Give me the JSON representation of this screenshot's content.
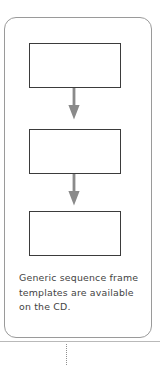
{
  "diagram": {
    "container": {
      "name": "sequence-frame-container",
      "border_color": "#9a9a9a",
      "corner_radius_px": 12
    },
    "boxes": [
      {
        "id": "box-1",
        "label": "",
        "border_color": "#3b3b3b"
      },
      {
        "id": "box-2",
        "label": "",
        "border_color": "#3b3b3b"
      },
      {
        "id": "box-3",
        "label": "",
        "border_color": "#3b3b3b"
      }
    ],
    "arrows": [
      {
        "id": "arrow-1",
        "direction": "down",
        "color": "#8a8a8a",
        "from": "box-1",
        "to": "box-2"
      },
      {
        "id": "arrow-2",
        "direction": "down",
        "color": "#8a8a8a",
        "from": "box-2",
        "to": "box-3"
      }
    ],
    "caption": "Generic sequence frame\ntemplates are available\non the CD.",
    "caption_color": "#434343",
    "connector": {
      "style": "dotted",
      "orientation": "vertical",
      "color": "#8f8f8f"
    },
    "rule_color": "#b9b9b9"
  }
}
